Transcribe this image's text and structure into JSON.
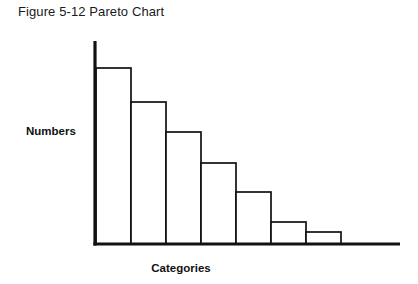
{
  "figure": {
    "title": "Figure 5-12 Pareto Chart"
  },
  "chart_data": {
    "type": "bar",
    "title": "Figure 5-12 Pareto Chart",
    "xlabel": "Categories",
    "ylabel": "Numbers",
    "categories": [
      "1",
      "2",
      "3",
      "4",
      "5",
      "6",
      "7"
    ],
    "values": [
      100,
      81,
      64,
      46,
      29,
      11,
      6
    ],
    "ylim": [
      0,
      116
    ],
    "grid": false,
    "legend": false,
    "bar_fill": "#ffffff",
    "bar_edge": "#111111",
    "axis_color": "#111111",
    "background": "#ffffff"
  },
  "geometry": {
    "axis_x": 95,
    "axis_top": 41,
    "baseline_y": 244,
    "baseline_right": 400,
    "bar_start_x": 96,
    "bar_width": 35,
    "bar_tops": [
      68,
      102,
      132,
      163,
      192,
      222,
      232
    ],
    "axis_stroke": 3.2,
    "bar_stroke": 1.7
  },
  "labels": {
    "y_axis": "Numbers",
    "y_axis_x": 26,
    "y_axis_y": 135,
    "x_axis": "Categories",
    "x_axis_x": 181,
    "x_axis_y": 272
  }
}
